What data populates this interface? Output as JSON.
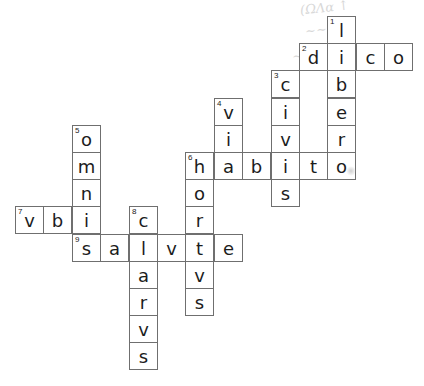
{
  "puzzle": {
    "type": "crossword",
    "cell_size_px": 28.4,
    "origin": {
      "x": 15,
      "y": 16
    },
    "clue_numbers": [
      {
        "num": "1",
        "row": 0,
        "col": 11
      },
      {
        "num": "2",
        "row": 1,
        "col": 10
      },
      {
        "num": "3",
        "row": 2,
        "col": 9
      },
      {
        "num": "4",
        "row": 3,
        "col": 7
      },
      {
        "num": "5",
        "row": 4,
        "col": 2
      },
      {
        "num": "6",
        "row": 5,
        "col": 6
      },
      {
        "num": "7",
        "row": 7,
        "col": 0
      },
      {
        "num": "8",
        "row": 7,
        "col": 4
      },
      {
        "num": "9",
        "row": 8,
        "col": 2
      }
    ],
    "answers": {
      "down": [
        {
          "num": "1",
          "word": "libero",
          "row": 0,
          "col": 11
        },
        {
          "num": "3",
          "word": "civis",
          "row": 2,
          "col": 9
        },
        {
          "num": "4",
          "word": "via",
          "row": 3,
          "col": 7
        },
        {
          "num": "5",
          "word": "omni",
          "row": 4,
          "col": 2
        },
        {
          "num": "6",
          "word": "hortvs",
          "row": 5,
          "col": 6
        },
        {
          "num": "8",
          "word": "clarvs",
          "row": 7,
          "col": 4
        }
      ],
      "across": [
        {
          "num": "2",
          "word": "dico",
          "row": 1,
          "col": 10
        },
        {
          "num": "6",
          "word": "habito",
          "row": 5,
          "col": 6
        },
        {
          "num": "7",
          "word": "vbi",
          "row": 7,
          "col": 0
        },
        {
          "num": "9",
          "word": "salvte",
          "row": 8,
          "col": 2
        }
      ]
    },
    "ghost_marks": [
      "(ΩΛα ↑",
      "~~~",
      "~~"
    ]
  }
}
